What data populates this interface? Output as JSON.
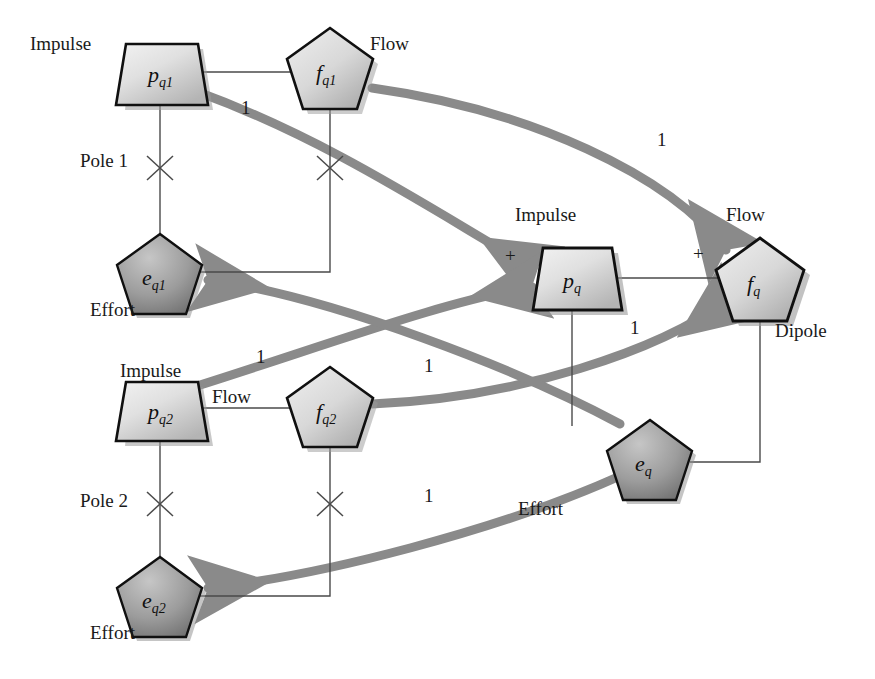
{
  "diagram": {
    "colors": {
      "curve": "#8a8a8a",
      "curve_dark": "#7d7d7d",
      "line": "#4a4a4a",
      "outline": "#101010",
      "impulse_fill_light": "#e8e8e8",
      "impulse_fill_dark": "#b9b9b9",
      "flow_fill_light": "#e4e4e4",
      "flow_fill_dark": "#b0b0b0",
      "effort_fill_light": "#b4b4b4",
      "effort_fill_dark": "#6f6f6f",
      "shadow": "#9a9a9a",
      "text": "#1a1a1a"
    },
    "nodes": [
      {
        "id": "pq1",
        "symbol": "p",
        "sub": "q1",
        "kind": "impulse",
        "shape": "trapezoid",
        "x": 155,
        "y": 72,
        "label": "Impulse",
        "label_pos": "left"
      },
      {
        "id": "fq1",
        "symbol": "f",
        "sub": "q1",
        "kind": "flow",
        "shape": "pentagon",
        "x": 330,
        "y": 65,
        "label": "Flow",
        "label_pos": "right"
      },
      {
        "id": "eq1",
        "symbol": "e",
        "sub": "q1",
        "kind": "effort",
        "shape": "pentagon",
        "x": 160,
        "y": 265,
        "label": "Effort",
        "label_pos": "below"
      },
      {
        "id": "pq2",
        "symbol": "p",
        "sub": "q2",
        "kind": "impulse",
        "shape": "trapezoid",
        "x": 155,
        "y": 408,
        "label": "Impulse",
        "label_pos": "above"
      },
      {
        "id": "fq2",
        "symbol": "f",
        "sub": "q2",
        "kind": "flow",
        "shape": "pentagon",
        "x": 330,
        "y": 404,
        "label": "Flow",
        "label_pos": "left"
      },
      {
        "id": "eq2",
        "symbol": "e",
        "sub": "q2",
        "kind": "effort",
        "shape": "pentagon",
        "x": 160,
        "y": 588,
        "label": "Effort",
        "label_pos": "below"
      },
      {
        "id": "pq",
        "symbol": "p",
        "sub": "q",
        "kind": "impulse",
        "shape": "trapezoid",
        "x": 572,
        "y": 278,
        "label": "Impulse",
        "label_pos": "above"
      },
      {
        "id": "fq",
        "symbol": "f",
        "sub": "q",
        "kind": "flow",
        "shape": "pentagon",
        "x": 760,
        "y": 276,
        "label": "Flow",
        "label_pos": "above"
      },
      {
        "id": "eq",
        "symbol": "e",
        "sub": "q",
        "kind": "effort",
        "shape": "pentagon",
        "x": 650,
        "y": 452,
        "label": "Effort",
        "label_pos": "below"
      }
    ],
    "group_labels": [
      {
        "text": "Pole 1",
        "x": 80,
        "y": 160
      },
      {
        "text": "Pole 2",
        "x": 80,
        "y": 500
      },
      {
        "text": "Dipole",
        "x": 775,
        "y": 330
      }
    ],
    "node_labels": [
      {
        "text": "Impulse",
        "x": 30,
        "y": 46
      },
      {
        "text": "Flow",
        "x": 370,
        "y": 46
      },
      {
        "text": "Effort",
        "x": 90,
        "y": 310
      },
      {
        "text": "Impulse",
        "x": 120,
        "y": 372
      },
      {
        "text": "Flow",
        "x": 212,
        "y": 397
      },
      {
        "text": "Effort",
        "x": 90,
        "y": 633
      },
      {
        "text": "Impulse",
        "x": 515,
        "y": 215
      },
      {
        "text": "Flow",
        "x": 726,
        "y": 215
      },
      {
        "text": "Effort",
        "x": 518,
        "y": 509
      }
    ],
    "edge_labels": [
      {
        "text": "1",
        "x": 241,
        "y": 108
      },
      {
        "text": "1",
        "x": 657,
        "y": 140
      },
      {
        "text": "1",
        "x": 256,
        "y": 357
      },
      {
        "text": "1",
        "x": 424,
        "y": 366
      },
      {
        "text": "1",
        "x": 630,
        "y": 328
      },
      {
        "text": "1",
        "x": 424,
        "y": 496
      }
    ],
    "sign_labels": [
      {
        "text": "+",
        "x": 505,
        "y": 256
      },
      {
        "text": "+",
        "x": 693,
        "y": 254
      }
    ],
    "pole_crosses": [
      {
        "x": 160,
        "y": 168
      },
      {
        "x": 330,
        "y": 168
      },
      {
        "x": 160,
        "y": 504
      },
      {
        "x": 330,
        "y": 504
      }
    ],
    "thin_connections": [
      {
        "from": "pq1",
        "to": "fq1",
        "kind": "horizontal"
      },
      {
        "from": "pq1",
        "to": "eq1",
        "kind": "vertical-through-pole"
      },
      {
        "from": "fq1",
        "to": "eq1",
        "kind": "down-then-left"
      },
      {
        "from": "pq2",
        "to": "fq2",
        "kind": "horizontal"
      },
      {
        "from": "pq2",
        "to": "eq2",
        "kind": "vertical-through-pole"
      },
      {
        "from": "fq2",
        "to": "eq2",
        "kind": "down-then-left"
      },
      {
        "from": "pq",
        "to": "fq",
        "kind": "horizontal"
      },
      {
        "from": "pq",
        "to": "eq",
        "kind": "vertical"
      },
      {
        "from": "fq",
        "to": "eq",
        "kind": "down-then-left"
      }
    ],
    "curved_arrows": [
      {
        "from": "pq1",
        "to": "pq",
        "weight": "1"
      },
      {
        "from": "fq1",
        "to": "fq",
        "weight": "1"
      },
      {
        "from": "eq",
        "to": "eq1",
        "weight": "1"
      },
      {
        "from": "pq2",
        "to": "pq",
        "weight": "1"
      },
      {
        "from": "fq2",
        "to": "fq",
        "weight": "1"
      },
      {
        "from": "eq",
        "to": "eq2",
        "weight": "1"
      }
    ]
  }
}
